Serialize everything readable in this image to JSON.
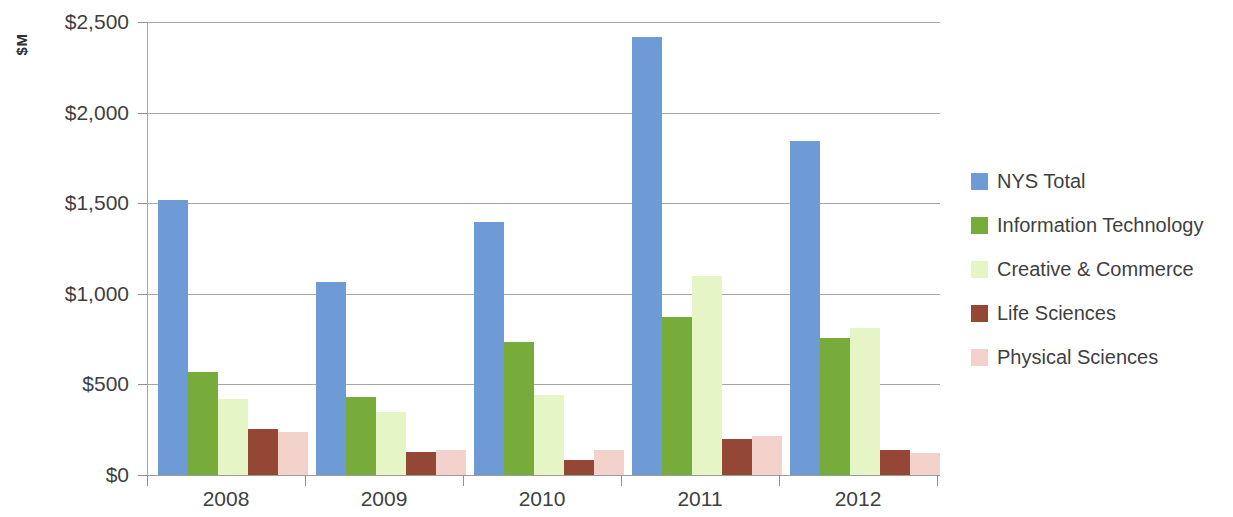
{
  "chart_data": {
    "type": "bar",
    "title": "",
    "subtitle": "",
    "xlabel": "",
    "ylabel": "$M",
    "categories": [
      "2008",
      "2009",
      "2010",
      "2011",
      "2012"
    ],
    "series": [
      {
        "name": "NYS Total",
        "color": "#6E9BD6",
        "values": [
          1515,
          1065,
          1395,
          2420,
          1845
        ]
      },
      {
        "name": "Information Technology",
        "color": "#77AC3B",
        "values": [
          570,
          430,
          735,
          870,
          755
        ]
      },
      {
        "name": "Creative & Commerce",
        "color": "#E6F5C6",
        "values": [
          420,
          350,
          440,
          1100,
          810
        ]
      },
      {
        "name": "Life Sciences",
        "color": "#954736",
        "values": [
          255,
          125,
          85,
          200,
          140
        ]
      },
      {
        "name": "Physical Sciences",
        "color": "#F2D2CB",
        "values": [
          240,
          140,
          140,
          215,
          120
        ]
      }
    ],
    "ylim": [
      0,
      2500
    ],
    "ytick_values": [
      0,
      500,
      1000,
      1500,
      2000,
      2500
    ],
    "ytick_labels": [
      "$0",
      "$500",
      "$1,000",
      "$1,500",
      "$2,000",
      "$2,500"
    ],
    "grid": true,
    "legend_position": "right"
  },
  "legend": {
    "items": [
      {
        "label": "NYS Total",
        "color": "#6E9BD6"
      },
      {
        "label": "Information Technology",
        "color": "#77AC3B"
      },
      {
        "label": "Creative & Commerce",
        "color": "#E6F5C6"
      },
      {
        "label": "Life Sciences",
        "color": "#954736"
      },
      {
        "label": "Physical Sciences",
        "color": "#F2D2CB"
      }
    ]
  }
}
